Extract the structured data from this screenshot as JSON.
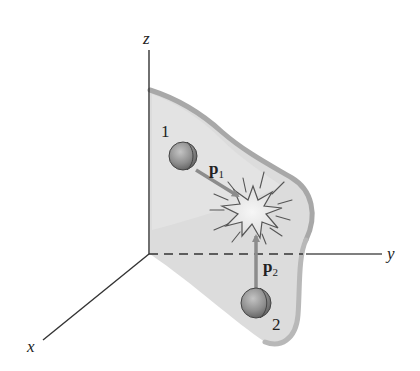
{
  "figure": {
    "axes": {
      "z_label": "z",
      "y_label": "y",
      "x_label": "x"
    },
    "particles": [
      {
        "label": "1",
        "momentum_label": "p",
        "momentum_subscript": "1"
      },
      {
        "label": "2",
        "momentum_label": "p",
        "momentum_subscript": "2"
      }
    ],
    "colors": {
      "plane_fill": "#dcdcdc",
      "plane_edge": "#a8a8a8",
      "axis": "#333333",
      "arrow": "#8c8c8c",
      "ball": "#9a9a9a",
      "burst": "#555555"
    }
  }
}
